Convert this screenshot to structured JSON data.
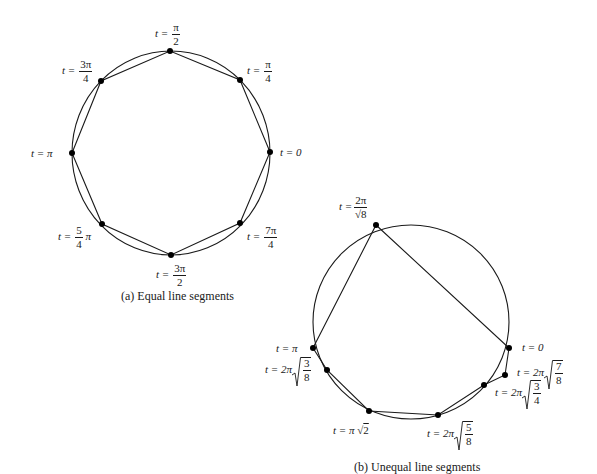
{
  "figure_a": {
    "caption": "(a) Equal line segments",
    "circle": {
      "cx": 171,
      "cy": 153,
      "r": 100
    },
    "points": [
      {
        "t": "0",
        "x": 270,
        "y": 152
      },
      {
        "t": "π/4",
        "x": 240,
        "y": 80
      },
      {
        "t": "π/2",
        "x": 170,
        "y": 51
      },
      {
        "t": "3π/4",
        "x": 101,
        "y": 81
      },
      {
        "t": "π",
        "x": 72,
        "y": 153
      },
      {
        "t": "5/4 π",
        "x": 102,
        "y": 224
      },
      {
        "t": "3π/2",
        "x": 171,
        "y": 255
      },
      {
        "t": "7π/4",
        "x": 240,
        "y": 223
      }
    ],
    "labels": {
      "t_eq": "t =",
      "t0": "t = 0",
      "t_pi": "t = π",
      "pi": "π",
      "two": "2",
      "four": "4",
      "three_pi": "3π",
      "five": "5",
      "seven_pi": "7π"
    }
  },
  "figure_b": {
    "caption": "(b) Unequal line segments",
    "circle": {
      "cx": 411,
      "cy": 322,
      "r": 98
    },
    "points": [
      {
        "t": "0",
        "x": 509,
        "y": 348
      },
      {
        "t": "2π√(7/8)",
        "x": 505,
        "y": 375
      },
      {
        "t": "2π√(3/4)",
        "x": 484,
        "y": 385
      },
      {
        "t": "2π√(5/8)",
        "x": 438,
        "y": 415
      },
      {
        "t": "π√2",
        "x": 369,
        "y": 411
      },
      {
        "t": "2π√(3/8)",
        "x": 327,
        "y": 370
      },
      {
        "t": "π",
        "x": 313,
        "y": 348
      },
      {
        "t": "2π/√8",
        "x": 376,
        "y": 225
      }
    ],
    "labels": {
      "t_eq": "t =",
      "t0": "t = 0",
      "t_pi": "t = π",
      "two_pi": "2π",
      "sqrt8": "8",
      "t_2pi": "t = 2π",
      "t_pi_sqrt2_a": "t = π",
      "sqrt2": "2",
      "three": "3",
      "four": "4",
      "five": "5",
      "seven": "7",
      "eight": "8"
    }
  }
}
